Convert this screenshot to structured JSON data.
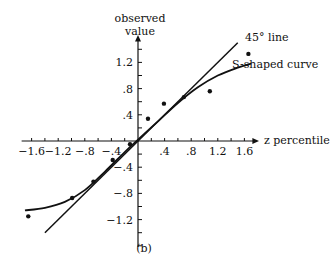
{
  "chart_data": {
    "type": "scatter",
    "title": "",
    "panel_label": "(b)",
    "xlabel": "z percentile",
    "ylabel_line1": "observed",
    "ylabel_line2": "value",
    "xlim": [
      -1.7,
      1.7
    ],
    "ylim": [
      -1.6,
      1.6
    ],
    "x_ticks": [
      -1.6,
      -1.2,
      -0.8,
      -0.4,
      0.4,
      0.8,
      1.2,
      1.6
    ],
    "x_tick_labels": [
      "−1.6",
      "−1.2",
      "−.8",
      "−.4",
      ".4",
      ".8",
      "1.2",
      "1.6"
    ],
    "y_ticks": [
      1.2,
      0.8,
      0.4,
      -0.4,
      -0.8,
      -1.2
    ],
    "y_tick_labels": [
      "1.2",
      ".8",
      ".4",
      "−.4",
      "−.8",
      "−1.2"
    ],
    "minor_tick_step": 0.2,
    "grid": false,
    "points": [
      {
        "x": -1.65,
        "y": -1.15
      },
      {
        "x": -0.99,
        "y": -0.87
      },
      {
        "x": -0.67,
        "y": -0.62
      },
      {
        "x": -0.38,
        "y": -0.29
      },
      {
        "x": -0.12,
        "y": -0.05
      },
      {
        "x": 0.15,
        "y": 0.34
      },
      {
        "x": 0.39,
        "y": 0.57
      },
      {
        "x": 0.69,
        "y": 0.67
      },
      {
        "x": 1.08,
        "y": 0.76
      },
      {
        "x": 1.66,
        "y": 1.33
      }
    ],
    "lines": [
      {
        "name": "45° line",
        "label": "45° line",
        "kind": "identity",
        "x_range": [
          -1.4,
          1.5
        ]
      },
      {
        "name": "S-shaped curve",
        "label": "S-shaped curve",
        "kind": "s-curve",
        "points": [
          [
            -1.7,
            -1.06
          ],
          [
            -1.4,
            -1.02
          ],
          [
            -1.1,
            -0.93
          ],
          [
            -0.8,
            -0.75
          ],
          [
            -0.5,
            -0.47
          ],
          [
            -0.2,
            -0.17
          ],
          [
            0,
            0.02
          ],
          [
            0.3,
            0.3
          ],
          [
            0.6,
            0.58
          ],
          [
            0.9,
            0.82
          ],
          [
            1.2,
            1.0
          ],
          [
            1.5,
            1.12
          ],
          [
            1.7,
            1.18
          ]
        ]
      }
    ]
  }
}
